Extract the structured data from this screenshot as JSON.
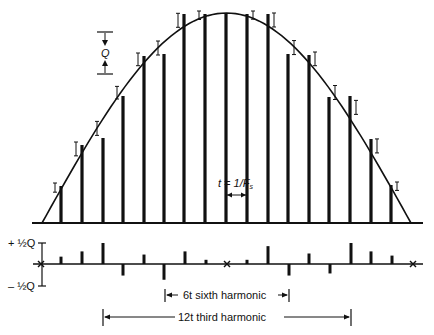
{
  "diagram": {
    "colors": {
      "ink": "#111111",
      "background": "#ffffff"
    },
    "quant_step_label": "Q",
    "sample_interval_label": "t = 1/F",
    "sample_interval_sub": "s",
    "error_plot": {
      "plus_label": "+ ½Q",
      "minus_label": "– ½Q"
    },
    "annotations": {
      "sixth": "6t sixth harmonic",
      "third": "12t third harmonic"
    }
  },
  "chart_data": {
    "type": "bar",
    "samples_x": [
      61,
      82,
      103,
      123,
      144,
      164,
      184,
      205,
      226,
      247,
      268,
      288,
      309,
      329,
      350,
      371,
      391
    ],
    "sample_top_y": [
      186,
      145,
      138,
      96,
      56,
      54,
      14,
      14,
      13,
      14,
      14,
      54,
      55,
      97,
      96,
      139,
      185
    ],
    "error_x": [
      41,
      61,
      82,
      103,
      123,
      144,
      164,
      185,
      206,
      227,
      247,
      268,
      289,
      309,
      330,
      351,
      371,
      392,
      413
    ],
    "error_values_halfQ": [
      0,
      0.35,
      0.6,
      1.0,
      -0.55,
      0.45,
      -0.75,
      0.6,
      0.2,
      0,
      0.2,
      0.85,
      -0.55,
      0.5,
      -0.45,
      1.0,
      0.6,
      0.4,
      0
    ],
    "error_zero_markers_x": [
      41,
      227,
      413
    ],
    "xlabel": "",
    "ylabel": ""
  }
}
